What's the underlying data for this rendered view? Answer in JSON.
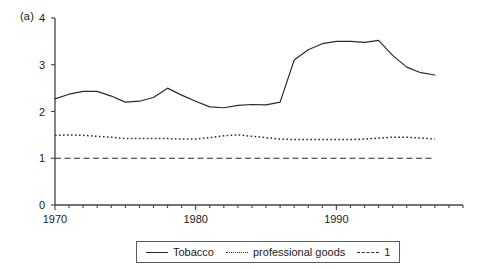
{
  "figure": {
    "panel_label": "(a)",
    "background_color": "#ffffff",
    "line_color": "#2b2b2b"
  },
  "legend": {
    "position": "bottom-center",
    "entries": [
      {
        "label": "Tobacco",
        "style": "solid"
      },
      {
        "label": "professional goods",
        "style": "dotted"
      },
      {
        "label": "1",
        "style": "dashed"
      }
    ]
  },
  "chart_data": {
    "type": "line",
    "title": "(a)",
    "xlabel": "",
    "ylabel": "",
    "xlim": [
      1970,
      1999
    ],
    "ylim": [
      0,
      4
    ],
    "yticks": [
      0,
      1,
      2,
      3,
      4
    ],
    "ytick_labels": [
      "0",
      "1",
      "2",
      "3",
      "4"
    ],
    "xticks": [
      1970,
      1980,
      1990
    ],
    "xtick_labels": [
      "1970",
      "1980",
      "1990"
    ],
    "minor_xticks_interval": 1,
    "grid": false,
    "x": [
      1970,
      1971,
      1972,
      1973,
      1974,
      1975,
      1976,
      1977,
      1978,
      1979,
      1980,
      1981,
      1982,
      1983,
      1984,
      1985,
      1986,
      1987,
      1988,
      1989,
      1990,
      1991,
      1992,
      1993,
      1994,
      1995,
      1996,
      1997
    ],
    "series": [
      {
        "name": "Tobacco",
        "style": "solid",
        "values": [
          2.27,
          2.37,
          2.43,
          2.43,
          2.33,
          2.2,
          2.22,
          2.3,
          2.5,
          2.35,
          2.22,
          2.1,
          2.08,
          2.13,
          2.15,
          2.14,
          2.2,
          3.1,
          3.32,
          3.45,
          3.5,
          3.5,
          3.48,
          3.52,
          3.2,
          2.95,
          2.83,
          2.78
        ]
      },
      {
        "name": "professional goods",
        "style": "dotted",
        "values": [
          1.49,
          1.5,
          1.49,
          1.47,
          1.45,
          1.42,
          1.42,
          1.42,
          1.42,
          1.41,
          1.41,
          1.44,
          1.48,
          1.5,
          1.47,
          1.44,
          1.41,
          1.4,
          1.4,
          1.4,
          1.4,
          1.4,
          1.41,
          1.43,
          1.45,
          1.45,
          1.43,
          1.41
        ]
      },
      {
        "name": "1",
        "style": "dashed",
        "values": [
          1.0,
          1.0,
          1.0,
          1.0,
          1.0,
          1.0,
          1.0,
          1.0,
          1.0,
          1.0,
          1.0,
          1.0,
          1.0,
          1.0,
          1.0,
          1.0,
          1.0,
          1.0,
          1.0,
          1.0,
          1.0,
          1.0,
          1.0,
          1.0,
          1.0,
          1.0,
          1.0,
          1.0
        ]
      }
    ]
  }
}
